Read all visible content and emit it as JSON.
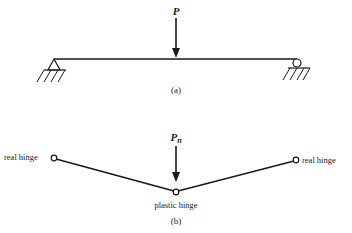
{
  "figure_a": {
    "load_label": "P",
    "caption": "(a)",
    "left_support": "pin",
    "right_support": "roller"
  },
  "figure_b": {
    "load_label": "P",
    "load_subscript": "n",
    "left_label": "real hinge",
    "right_label": "real hinge",
    "center_label": "plastic hinge",
    "caption": "(b)"
  },
  "colors": {
    "ink": "#1a1a1a",
    "background": "#ffffff"
  }
}
